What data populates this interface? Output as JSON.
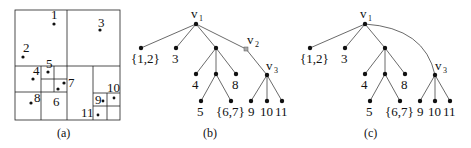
{
  "figure": {
    "panel_a": {
      "caption": "(a)",
      "points": [
        {
          "label": "1",
          "x": 54,
          "y": 24
        },
        {
          "label": "3",
          "x": 100,
          "y": 30
        },
        {
          "label": "2",
          "x": 23,
          "y": 57
        },
        {
          "label": "4",
          "x": 33,
          "y": 79
        },
        {
          "label": "5",
          "x": 48,
          "y": 72
        },
        {
          "label": "7",
          "x": 64,
          "y": 83
        },
        {
          "label": "6",
          "x": 58,
          "y": 89
        },
        {
          "label": "8",
          "x": 31,
          "y": 103
        },
        {
          "label": "9",
          "x": 103,
          "y": 101
        },
        {
          "label": "10",
          "x": 114,
          "y": 98
        },
        {
          "label": "11",
          "x": 98,
          "y": 115
        }
      ]
    },
    "panel_b": {
      "caption": "(b)",
      "root_label": "v",
      "root_sub": "1",
      "v2_label": "v",
      "v2_sub": "2",
      "v3_label": "v",
      "v3_sub": "3",
      "leaf_labels": [
        "{1,2}",
        "3",
        "4",
        "8",
        "5",
        "{6,7}",
        "9",
        "10",
        "11"
      ]
    },
    "panel_c": {
      "caption": "(c)",
      "root_label": "v",
      "root_sub": "1",
      "v3_label": "v",
      "v3_sub": "3",
      "leaf_labels": [
        "{1,2}",
        "3",
        "4",
        "8",
        "5",
        "{6,7}",
        "9",
        "10",
        "11"
      ]
    }
  }
}
